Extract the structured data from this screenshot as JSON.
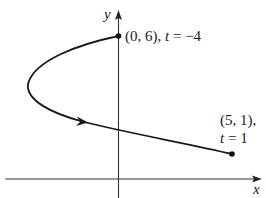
{
  "diagram": {
    "type": "parametric-curve",
    "axes": {
      "x_label": "x",
      "y_label": "y"
    },
    "points": [
      {
        "id": "start",
        "coord": "(0, 6)",
        "param_var": "t",
        "param_value": "−4",
        "label": "(0, 6), t = −4"
      },
      {
        "id": "end",
        "coord": "(5, 1),",
        "param_var": "t",
        "param_value": "1",
        "label": "(5, 1), t = 1"
      }
    ],
    "curve": {
      "direction": "from (0,6) to (5,1)",
      "arrow": "direction-of-increasing-t"
    },
    "colors": {
      "curve": "#1a1a1a",
      "axes": "#333333",
      "background": "#ffffff"
    }
  }
}
